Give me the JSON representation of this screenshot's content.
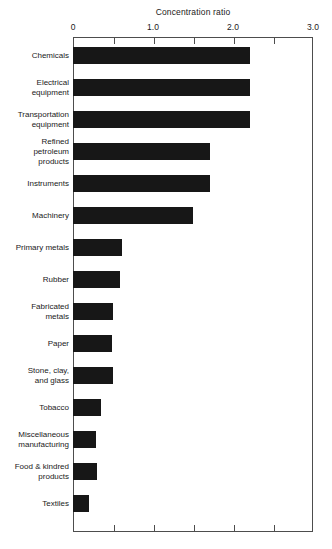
{
  "chart_data": {
    "type": "bar",
    "orientation": "horizontal",
    "title": "Concentration ratio",
    "xlabel": "",
    "ylabel": "",
    "xlim": [
      0,
      3.0
    ],
    "grid": false,
    "legend": null,
    "tick_labels": [
      "0",
      "1.0",
      "2.0",
      "3.0"
    ],
    "tick_values": [
      0,
      1.0,
      2.0,
      3.0
    ],
    "minor_tick_values": [
      0.5,
      1.5,
      2.5
    ],
    "categories": [
      "Chemicals",
      "Electrical\nequipment",
      "Transportation\nequipment",
      "Refined\npetroleum\nproducts",
      "Instruments",
      "Machinery",
      "Primary metals",
      "Rubber",
      "Fabricated\nmetals",
      "Paper",
      "Stone, clay,\nand glass",
      "Tobacco",
      "Miscellaneous\nmanufacturing",
      "Food & kindred\nproducts",
      "Textiles"
    ],
    "values": [
      2.21,
      2.21,
      2.21,
      1.71,
      1.71,
      1.5,
      0.61,
      0.59,
      0.5,
      0.49,
      0.5,
      0.35,
      0.29,
      0.3,
      0.2
    ],
    "bar_color": "#171717"
  }
}
